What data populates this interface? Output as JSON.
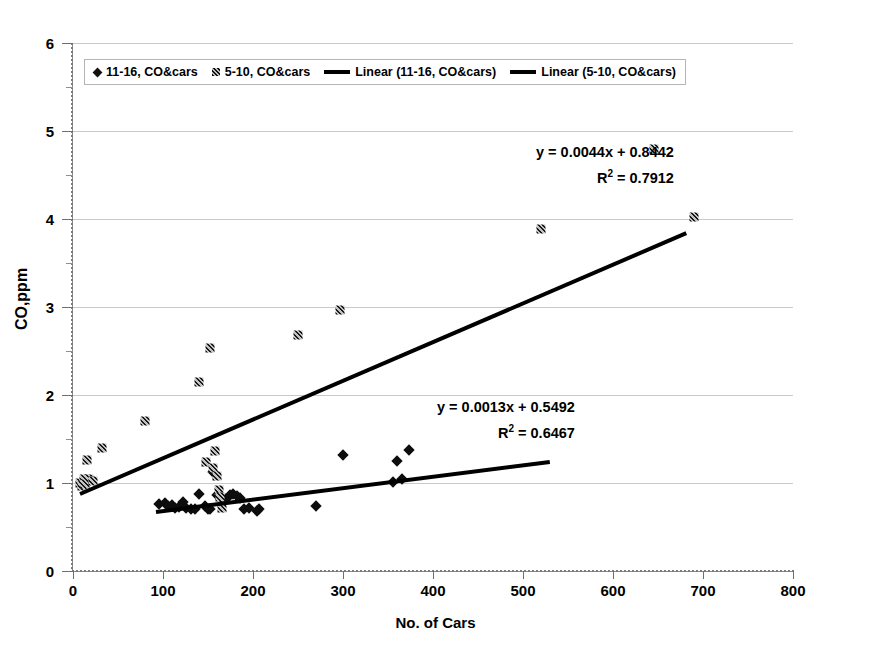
{
  "chart_data": {
    "type": "scatter",
    "title": "",
    "xlabel": "No. of Cars",
    "ylabel": "CO,ppm",
    "xlim": [
      0,
      800
    ],
    "ylim": [
      0,
      6
    ],
    "xticks": [
      "0",
      "100",
      "200",
      "300",
      "400",
      "500",
      "600",
      "700",
      "800"
    ],
    "yticks": [
      "0",
      "1",
      "2",
      "3",
      "4",
      "5",
      "6"
    ],
    "grid": "horizontal-major",
    "legend_position": "top-left-inside",
    "legend": [
      {
        "label": "11-16, CO&cars",
        "marker": "diamond"
      },
      {
        "label": "5-10, CO&cars",
        "marker": "square"
      },
      {
        "label": "Linear (11-16, CO&cars)",
        "marker": "line"
      },
      {
        "label": "Linear (5-10, CO&cars)",
        "marker": "line"
      }
    ],
    "series": [
      {
        "name": "11-16, CO&cars",
        "marker": "diamond",
        "points": [
          [
            96,
            0.76
          ],
          [
            102,
            0.77
          ],
          [
            106,
            0.74
          ],
          [
            110,
            0.75
          ],
          [
            113,
            0.72
          ],
          [
            118,
            0.73
          ],
          [
            122,
            0.78
          ],
          [
            126,
            0.72
          ],
          [
            131,
            0.71
          ],
          [
            136,
            0.7
          ],
          [
            140,
            0.88
          ],
          [
            147,
            0.74
          ],
          [
            150,
            0.71
          ],
          [
            152,
            0.7
          ],
          [
            156,
            1.13
          ],
          [
            160,
            0.86
          ],
          [
            163,
            0.84
          ],
          [
            166,
            0.83
          ],
          [
            170,
            0.82
          ],
          [
            174,
            0.86
          ],
          [
            178,
            0.87
          ],
          [
            182,
            0.85
          ],
          [
            186,
            0.83
          ],
          [
            190,
            0.71
          ],
          [
            196,
            0.72
          ],
          [
            204,
            0.68
          ],
          [
            207,
            0.71
          ],
          [
            270,
            0.74
          ],
          [
            300,
            1.32
          ],
          [
            355,
            1.01
          ],
          [
            360,
            1.25
          ],
          [
            366,
            1.05
          ],
          [
            373,
            1.37
          ]
        ]
      },
      {
        "name": "5-10, CO&cars",
        "marker": "square",
        "points": [
          [
            8,
            1.0
          ],
          [
            10,
            0.97
          ],
          [
            12,
            1.04
          ],
          [
            13,
            0.99
          ],
          [
            15,
            1.26
          ],
          [
            18,
            1.05
          ],
          [
            22,
            1.02
          ],
          [
            32,
            1.4
          ],
          [
            80,
            1.71
          ],
          [
            140,
            2.15
          ],
          [
            148,
            1.24
          ],
          [
            152,
            2.53
          ],
          [
            155,
            1.17
          ],
          [
            158,
            1.36
          ],
          [
            160,
            1.08
          ],
          [
            162,
            0.92
          ],
          [
            163,
            0.84
          ],
          [
            166,
            0.72
          ],
          [
            250,
            2.68
          ],
          [
            297,
            2.97
          ],
          [
            520,
            3.89
          ],
          [
            645,
            4.8
          ],
          [
            690,
            4.02
          ]
        ]
      }
    ],
    "trendlines": [
      {
        "name": "Linear (5-10, CO&cars)",
        "equation": "y = 0.0044x + 0.8442",
        "r_squared": "R² = 0.7912",
        "slope": 0.0044,
        "intercept": 0.8442,
        "x_start": 8,
        "x_end": 682,
        "label_line1": "y = 0.0044x + 0.8442",
        "label_line2_prefix": "R",
        "label_line2_sup": "2",
        "label_line2_suffix": " = 0.7912"
      },
      {
        "name": "Linear (11-16, CO&cars)",
        "equation": "y = 0.0013x + 0.5492",
        "r_squared": "R² = 0.6467",
        "slope": 0.0013,
        "intercept": 0.5492,
        "x_start": 92,
        "x_end": 530,
        "label_line1": "y = 0.0013x + 0.5492",
        "label_line2_prefix": "R",
        "label_line2_sup": "2",
        "label_line2_suffix": " = 0.6467"
      }
    ]
  }
}
